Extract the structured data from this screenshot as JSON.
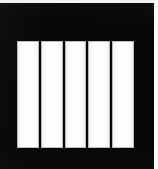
{
  "image": {
    "width": 158,
    "height": 169,
    "kind": "scanned-figure",
    "description": "Black rectangular field containing five white vertical bars"
  },
  "colors": {
    "field": "#070707",
    "bar_fill": "#fdfdfd",
    "bar_outline": "#787878",
    "separator": "#070707",
    "scan_margin_top": "#f2f2f2",
    "scan_margin_right": "#fbfbfb",
    "page_background": "#ffffff"
  },
  "frame": {
    "name": "black-field",
    "x": 0,
    "y": 3,
    "width": 154,
    "height": 166
  },
  "bar_group": {
    "name": "vertical-bar-group",
    "x": 17,
    "y": 38,
    "width": 117,
    "height": 107,
    "count": 5,
    "separator_width": 2,
    "bars": [
      {
        "index": 1,
        "label": "",
        "fill": "#fdfdfd",
        "x": 17,
        "width": 22
      },
      {
        "index": 2,
        "label": "",
        "fill": "#fdfdfd",
        "x": 41,
        "width": 22
      },
      {
        "index": 3,
        "label": "",
        "fill": "#fdfdfd",
        "x": 65,
        "width": 22
      },
      {
        "index": 4,
        "label": "",
        "fill": "#fdfdfd",
        "x": 88,
        "width": 22
      },
      {
        "index": 5,
        "label": "",
        "fill": "#fdfdfd",
        "x": 112,
        "width": 22
      }
    ]
  },
  "margins": {
    "top_strip_height": 3,
    "right_strip_width": 4
  }
}
